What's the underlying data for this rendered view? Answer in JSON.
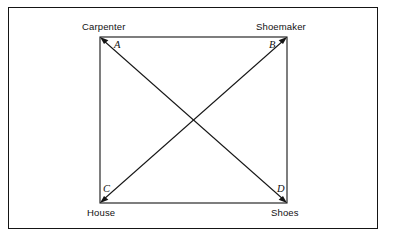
{
  "figure": {
    "title": "",
    "background_color": "#ffffff",
    "line_color": "#151515",
    "frame": {
      "present": true,
      "stroke": "#151515"
    }
  },
  "diagram": {
    "type": "square-with-diagonals",
    "square": {
      "x": 100,
      "y": 37,
      "width": 187,
      "height": 166
    },
    "vertices": [
      {
        "id": "A",
        "letter": "A",
        "label": "Carpenter",
        "position": "top-left",
        "x": 100,
        "y": 37,
        "arrowhead": "up-left"
      },
      {
        "id": "B",
        "letter": "B",
        "label": "Shoemaker",
        "position": "top-right",
        "x": 287,
        "y": 37,
        "arrowhead": "up-right"
      },
      {
        "id": "C",
        "letter": "C",
        "label": "House",
        "position": "bottom-left",
        "x": 100,
        "y": 203,
        "arrowhead": "down-left"
      },
      {
        "id": "D",
        "letter": "D",
        "label": "Shoes",
        "position": "bottom-right",
        "x": 287,
        "y": 203,
        "arrowhead": "down-right"
      }
    ],
    "diagonals": [
      {
        "id": "AD",
        "from": "A",
        "to": "D",
        "arrows": "both"
      },
      {
        "id": "BC",
        "from": "B",
        "to": "C",
        "arrows": "both"
      }
    ],
    "intersection": {
      "x": 194,
      "y": 120
    }
  }
}
